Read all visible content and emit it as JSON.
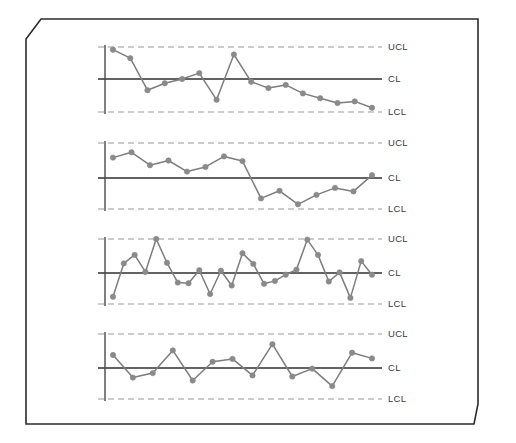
{
  "figure": {
    "name": "control-charts-panel",
    "background_color": "#ffffff",
    "frame": {
      "name": "beveled-border-frame",
      "stroke_color": "#2b2b2b",
      "stroke_width": 1.6,
      "bevel_corners": [
        "top-left",
        "bottom-right"
      ]
    },
    "style": {
      "marker_color": "#8a8a8a",
      "line_color": "#7d7d7d",
      "cl_line_color": "#2f2f2f",
      "limit_line_color": "#9a9a9a",
      "axis_color": "#4a4a4a",
      "label_color": "#3a3a3a"
    }
  },
  "chart_data": [
    {
      "type": "line",
      "title": "",
      "subtitle": "",
      "xlabel": "",
      "ylabel": "",
      "id": "chart-1-downward-trend",
      "grid": false,
      "legend": "right-inline",
      "annotations": [
        "UCL",
        "CL",
        "LCL"
      ],
      "limits": {
        "UCL": 3,
        "CL": 0,
        "LCL": -3
      },
      "ylim": [
        -3,
        3
      ],
      "xlim": [
        0,
        21
      ],
      "x": [
        1,
        2,
        3,
        4,
        5,
        6,
        7,
        8,
        9,
        10,
        11,
        12,
        13,
        14,
        15,
        16,
        17,
        18,
        19,
        20
      ],
      "values": [
        2.75,
        1.95,
        -1.05,
        -0.4,
        0.0,
        0.55,
        -1.95,
        2.3,
        -0.25,
        -0.85,
        -0.55,
        -1.35,
        -1.8,
        -2.25,
        -2.1,
        -2.7
      ],
      "series": [
        {
          "name": "subgroup-mean",
          "values": [
            2.75,
            1.95,
            -1.05,
            -0.4,
            0.0,
            0.55,
            -1.95,
            2.3,
            -0.25,
            -0.85,
            -0.55,
            -1.35,
            -1.8,
            -2.25,
            -2.1,
            -2.7
          ]
        }
      ]
    },
    {
      "type": "line",
      "title": "",
      "subtitle": "",
      "xlabel": "",
      "ylabel": "",
      "id": "chart-2-level-shift",
      "grid": false,
      "legend": "right-inline",
      "annotations": [
        "UCL",
        "CL",
        "LCL"
      ],
      "limits": {
        "UCL": 3,
        "CL": 0,
        "LCL": -3
      },
      "ylim": [
        -3,
        3
      ],
      "xlim": [
        0,
        21
      ],
      "x": [
        1,
        2,
        3,
        4,
        5,
        6,
        7,
        8,
        9,
        10,
        11,
        12,
        13,
        14,
        15,
        16,
        17,
        18
      ],
      "values": [
        1.75,
        2.2,
        1.1,
        1.5,
        0.55,
        0.95,
        1.85,
        1.45,
        -1.75,
        -1.1,
        -2.25,
        -1.45,
        -0.85,
        -1.15,
        0.25
      ],
      "series": [
        {
          "name": "subgroup-mean",
          "values": [
            1.75,
            2.2,
            1.1,
            1.5,
            0.55,
            0.95,
            1.85,
            1.45,
            -1.75,
            -1.1,
            -2.25,
            -1.45,
            -0.85,
            -1.15,
            0.25
          ]
        }
      ]
    },
    {
      "type": "line",
      "title": "",
      "subtitle": "",
      "xlabel": "",
      "ylabel": "",
      "id": "chart-3-high-variation",
      "grid": false,
      "legend": "right-inline",
      "annotations": [
        "UCL",
        "CL",
        "LCL"
      ],
      "limits": {
        "UCL": 3,
        "CL": 0,
        "LCL": -3
      },
      "ylim": [
        -3,
        3
      ],
      "xlim": [
        0,
        31
      ],
      "x": [
        1,
        2,
        3,
        4,
        5,
        6,
        7,
        8,
        9,
        10,
        11,
        12,
        13,
        14,
        15,
        16,
        17,
        18,
        19,
        20,
        21,
        22,
        23,
        24,
        25,
        26,
        27,
        28,
        29
      ],
      "values": [
        -2.1,
        0.85,
        1.6,
        0.1,
        3.0,
        0.9,
        -0.85,
        -0.9,
        0.25,
        -1.85,
        0.2,
        -1.1,
        1.75,
        0.8,
        -0.95,
        -0.7,
        -0.15,
        0.3,
        2.95,
        1.6,
        -0.75,
        0.05,
        -2.2,
        1.05,
        -0.15
      ],
      "series": [
        {
          "name": "subgroup-mean",
          "values": [
            -2.1,
            0.85,
            1.6,
            0.1,
            3.0,
            0.9,
            -0.85,
            -0.9,
            0.25,
            -1.85,
            0.2,
            -1.1,
            1.75,
            0.8,
            -0.95,
            -0.7,
            -0.15,
            0.3,
            2.95,
            1.6,
            -0.75,
            0.05,
            -2.2,
            1.05,
            -0.15
          ]
        }
      ]
    },
    {
      "type": "line",
      "title": "",
      "subtitle": "",
      "xlabel": "",
      "ylabel": "",
      "id": "chart-4-in-control",
      "grid": false,
      "legend": "right-inline",
      "annotations": [
        "UCL",
        "CL",
        "LCL"
      ],
      "limits": {
        "UCL": 3,
        "CL": 0,
        "LCL": -3
      },
      "ylim": [
        -3,
        3
      ],
      "xlim": [
        0,
        26
      ],
      "x": [
        1,
        2,
        3,
        4,
        5,
        6,
        7,
        8,
        9,
        10,
        11,
        12,
        13,
        14,
        15,
        16,
        17,
        18,
        19,
        20,
        21,
        22,
        23
      ],
      "values": [
        1.15,
        -0.85,
        -0.45,
        1.55,
        -1.1,
        0.55,
        0.8,
        -0.65,
        2.1,
        -0.75,
        -0.05,
        -1.6,
        1.35,
        0.85
      ],
      "series": [
        {
          "name": "subgroup-mean",
          "values": [
            1.15,
            -0.85,
            -0.45,
            1.55,
            -1.1,
            0.55,
            0.8,
            -0.65,
            2.1,
            -0.75,
            -0.05,
            -1.6,
            1.35,
            0.85
          ]
        }
      ]
    }
  ],
  "labels": {
    "ucl": "UCL",
    "cl": "CL",
    "lcl": "LCL"
  }
}
